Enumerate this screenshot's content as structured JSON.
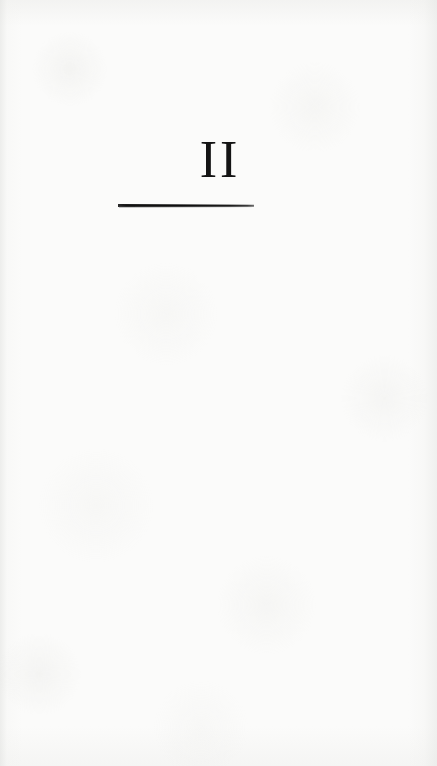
{
  "page": {
    "kind": "book-part-divider",
    "width": 437,
    "height": 766,
    "paper_color": "#fbfbfa",
    "ink_color": "#141414"
  },
  "divider": {
    "part_number": "II",
    "rule": {
      "label": "horizontal-rule",
      "color": "#0d0d0d"
    }
  }
}
